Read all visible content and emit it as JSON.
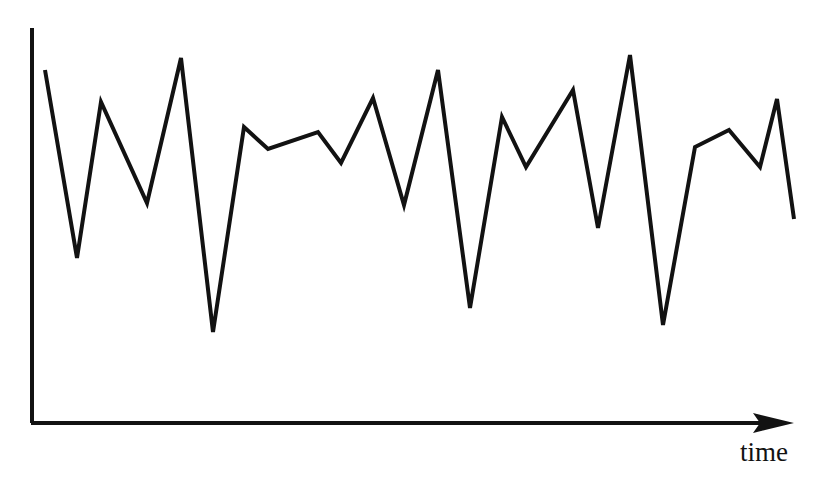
{
  "figure": {
    "name": "time-series-sketch",
    "background_color": "#ffffff",
    "ink_color": "#121212"
  },
  "axes": {
    "x_axis_label": "time",
    "y_axis_label": "",
    "origin": {
      "x": 32,
      "y": 423
    },
    "y_axis_top": {
      "x": 32,
      "y": 28
    },
    "x_axis_end": {
      "x": 794,
      "y": 423
    },
    "x_axis_has_arrow": true,
    "y_axis_has_arrow": false,
    "tick_labels_x": [],
    "tick_labels_y": [],
    "grid": false
  },
  "chart_data": {
    "type": "line",
    "title": "",
    "subtitle": "",
    "xlabel": "time",
    "ylabel": "",
    "grid": false,
    "legend": [],
    "legend_position": "none",
    "annotations": [],
    "xlim": [
      0,
      31
    ],
    "ylim": [
      0,
      100
    ],
    "x": [
      0,
      1,
      2,
      3,
      4,
      5,
      6,
      7,
      8,
      9,
      10,
      11,
      12,
      13,
      14,
      15,
      16,
      17,
      18,
      19,
      20,
      21,
      22,
      23,
      24,
      25,
      26,
      27,
      28,
      29,
      30
    ],
    "series": [
      {
        "name": "value",
        "color": "#121212",
        "values": [
          89,
          42,
          81,
          56,
          92,
          23,
          75,
          69,
          74,
          66,
          82,
          55,
          89,
          29,
          77,
          74,
          65,
          82,
          50,
          93,
          25,
          73,
          76,
          66,
          83,
          60,
          88,
          38,
          73,
          55,
          65
        ]
      }
    ],
    "pixel_points": [
      [
        45,
        70
      ],
      [
        77,
        258
      ],
      [
        101,
        102
      ],
      [
        147,
        203
      ],
      [
        181,
        58
      ],
      [
        213,
        332
      ],
      [
        244,
        127
      ],
      [
        268,
        149
      ],
      [
        318,
        132
      ],
      [
        341,
        163
      ],
      [
        373,
        98
      ],
      [
        404,
        205
      ],
      [
        438,
        70
      ],
      [
        470,
        308
      ],
      [
        502,
        117
      ],
      [
        526,
        167
      ],
      [
        573,
        90
      ],
      [
        598,
        228
      ],
      [
        630,
        55
      ],
      [
        663,
        325
      ],
      [
        695,
        147
      ],
      [
        729,
        130
      ],
      [
        760,
        167
      ],
      [
        777,
        99
      ],
      [
        794,
        219
      ]
    ],
    "stroke_width": 4
  },
  "style": {
    "line_color": "#121212",
    "axis_color": "#121212",
    "axis_stroke_width": 4,
    "line_stroke_width": 4
  }
}
